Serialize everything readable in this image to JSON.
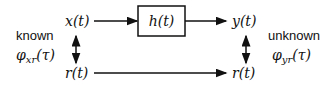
{
  "diagram": {
    "type": "block-diagram",
    "nodes": {
      "input": "x(t)",
      "system": "h(t)",
      "output": "y(t)",
      "reference_left": "r(t)",
      "reference_right": "r(t)"
    },
    "left_annotation": {
      "status": "known",
      "phi": "φ",
      "subscript": "xr",
      "arg": "(τ)"
    },
    "right_annotation": {
      "status": "unknown",
      "phi": "φ",
      "subscript": "yr",
      "arg": "(τ)"
    },
    "colors": {
      "stroke": "#111111",
      "background": "#ffffff"
    }
  }
}
